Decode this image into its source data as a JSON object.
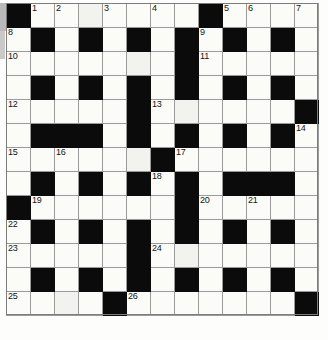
{
  "puzzle": {
    "type": "crossword-grid",
    "columns": 13,
    "rows": 13,
    "cell_size_px": 24,
    "colors": {
      "block": "#0b0b0b",
      "light": "#fbfbf8",
      "rule": "#9a9a9a",
      "number": "#141414"
    },
    "legend": {
      "1": "block (filled / black square)",
      "0": "light (writable square)"
    },
    "blocks": [
      [
        1,
        0,
        0,
        0,
        0,
        0,
        0,
        0,
        1,
        0,
        0,
        0,
        0
      ],
      [
        0,
        1,
        0,
        1,
        0,
        1,
        0,
        1,
        0,
        1,
        0,
        1,
        0
      ],
      [
        0,
        0,
        0,
        0,
        0,
        0,
        0,
        1,
        0,
        0,
        0,
        0,
        0
      ],
      [
        0,
        1,
        0,
        1,
        0,
        1,
        0,
        1,
        0,
        1,
        0,
        1,
        0
      ],
      [
        0,
        0,
        0,
        0,
        0,
        1,
        0,
        0,
        0,
        0,
        0,
        0,
        1
      ],
      [
        0,
        1,
        1,
        1,
        0,
        1,
        0,
        1,
        0,
        1,
        0,
        1,
        0
      ],
      [
        0,
        0,
        0,
        0,
        0,
        0,
        1,
        0,
        0,
        0,
        0,
        0,
        0
      ],
      [
        0,
        1,
        0,
        1,
        0,
        1,
        0,
        1,
        0,
        1,
        1,
        1,
        0
      ],
      [
        1,
        0,
        0,
        0,
        0,
        0,
        0,
        1,
        0,
        0,
        0,
        0,
        0
      ],
      [
        0,
        1,
        0,
        1,
        0,
        1,
        0,
        1,
        0,
        1,
        0,
        1,
        0
      ],
      [
        0,
        0,
        0,
        0,
        0,
        1,
        0,
        0,
        0,
        0,
        0,
        0,
        0
      ],
      [
        0,
        1,
        0,
        1,
        0,
        1,
        0,
        1,
        0,
        1,
        0,
        1,
        0
      ],
      [
        0,
        0,
        0,
        0,
        1,
        0,
        0,
        0,
        0,
        0,
        0,
        0,
        1
      ]
    ],
    "clue_numbers": [
      {
        "number": "1",
        "row": 0,
        "col": 1
      },
      {
        "number": "2",
        "row": 0,
        "col": 2
      },
      {
        "number": "3",
        "row": 0,
        "col": 4
      },
      {
        "number": "4",
        "row": 0,
        "col": 6
      },
      {
        "number": "5",
        "row": 0,
        "col": 9
      },
      {
        "number": "6",
        "row": 0,
        "col": 10
      },
      {
        "number": "7",
        "row": 0,
        "col": 12
      },
      {
        "number": "8",
        "row": 1,
        "col": 0
      },
      {
        "number": "9",
        "row": 1,
        "col": 8
      },
      {
        "number": "10",
        "row": 2,
        "col": 0
      },
      {
        "number": "11",
        "row": 2,
        "col": 8
      },
      {
        "number": "12",
        "row": 4,
        "col": 0
      },
      {
        "number": "13",
        "row": 4,
        "col": 6
      },
      {
        "number": "14",
        "row": 5,
        "col": 12
      },
      {
        "number": "15",
        "row": 6,
        "col": 0
      },
      {
        "number": "16",
        "row": 6,
        "col": 2
      },
      {
        "number": "17",
        "row": 6,
        "col": 7
      },
      {
        "number": "18",
        "row": 7,
        "col": 6
      },
      {
        "number": "19",
        "row": 8,
        "col": 1
      },
      {
        "number": "20",
        "row": 8,
        "col": 8
      },
      {
        "number": "21",
        "row": 8,
        "col": 10
      },
      {
        "number": "22",
        "row": 9,
        "col": 0
      },
      {
        "number": "23",
        "row": 10,
        "col": 0
      },
      {
        "number": "24",
        "row": 10,
        "col": 6
      },
      {
        "number": "25",
        "row": 12,
        "col": 0
      },
      {
        "number": "26",
        "row": 12,
        "col": 5
      }
    ],
    "tinted_cells": [
      {
        "row": 0,
        "col": 3
      },
      {
        "row": 2,
        "col": 5
      },
      {
        "row": 4,
        "col": 7
      },
      {
        "row": 6,
        "col": 5
      },
      {
        "row": 10,
        "col": 7
      },
      {
        "row": 12,
        "col": 2
      }
    ],
    "filled_letters": []
  }
}
